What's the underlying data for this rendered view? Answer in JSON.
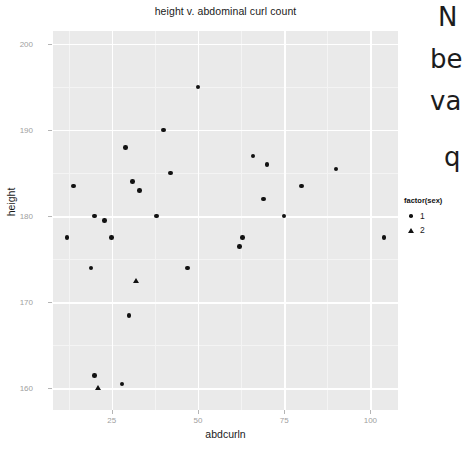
{
  "chart_data": {
    "type": "scatter",
    "title": "height v. abdominal curl count",
    "xlabel": "abdcurln",
    "ylabel": "height",
    "xlim": [
      8,
      108
    ],
    "ylim": [
      157.5,
      201.5
    ],
    "xticks": [
      25,
      50,
      75,
      100
    ],
    "yticks": [
      200,
      190,
      180,
      170,
      160
    ],
    "grid": true,
    "legend": {
      "title": "factor(sex)",
      "position": "right",
      "entries": [
        {
          "label": "1",
          "marker": "circle"
        },
        {
          "label": "2",
          "marker": "triangle"
        }
      ]
    },
    "series": [
      {
        "name": "1",
        "marker": "circle",
        "points": [
          {
            "x": 50,
            "y": 195
          },
          {
            "x": 40,
            "y": 190
          },
          {
            "x": 29,
            "y": 188
          },
          {
            "x": 66,
            "y": 187
          },
          {
            "x": 70,
            "y": 186
          },
          {
            "x": 90,
            "y": 185.5
          },
          {
            "x": 42,
            "y": 185
          },
          {
            "x": 31,
            "y": 184
          },
          {
            "x": 14,
            "y": 183.5
          },
          {
            "x": 33,
            "y": 183
          },
          {
            "x": 80,
            "y": 183.5
          },
          {
            "x": 69,
            "y": 182
          },
          {
            "x": 20,
            "y": 180
          },
          {
            "x": 38,
            "y": 180
          },
          {
            "x": 75,
            "y": 180
          },
          {
            "x": 23,
            "y": 179.5
          },
          {
            "x": 12,
            "y": 177.5
          },
          {
            "x": 25,
            "y": 177.5
          },
          {
            "x": 63,
            "y": 177.5
          },
          {
            "x": 104,
            "y": 177.5
          },
          {
            "x": 62,
            "y": 176.5
          },
          {
            "x": 19,
            "y": 174
          },
          {
            "x": 47,
            "y": 174
          },
          {
            "x": 30,
            "y": 168.5
          },
          {
            "x": 20,
            "y": 161.5
          },
          {
            "x": 28,
            "y": 160.5
          }
        ]
      },
      {
        "name": "2",
        "marker": "triangle",
        "points": [
          {
            "x": 32,
            "y": 172.5
          },
          {
            "x": 21,
            "y": 160
          }
        ]
      }
    ]
  },
  "side_text": {
    "lines": [
      "N",
      "be",
      "va",
      "q"
    ]
  }
}
